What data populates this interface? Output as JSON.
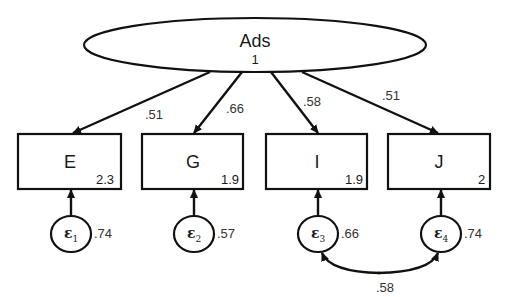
{
  "diagram": {
    "type": "structural-equation-model",
    "latent": {
      "name": "Ads",
      "variance": "1"
    },
    "observed": [
      {
        "name": "E",
        "intercept": "2.3",
        "loading": ".51",
        "error": {
          "symbol": "ε",
          "index": "1",
          "variance": ".74"
        }
      },
      {
        "name": "G",
        "intercept": "1.9",
        "loading": ".66",
        "error": {
          "symbol": "ε",
          "index": "2",
          "variance": ".57"
        }
      },
      {
        "name": "I",
        "intercept": "1.9",
        "loading": ".58",
        "error": {
          "symbol": "ε",
          "index": "3",
          "variance": ".66"
        }
      },
      {
        "name": "J",
        "intercept": "2",
        "loading": ".51",
        "error": {
          "symbol": "ε",
          "index": "4",
          "variance": ".74"
        }
      }
    ],
    "covariances": [
      {
        "from": "ε3",
        "to": "ε4",
        "value": ".58"
      }
    ],
    "colors": {
      "stroke": "#111111",
      "background": "#ffffff",
      "text": "#1a1a1a"
    }
  }
}
